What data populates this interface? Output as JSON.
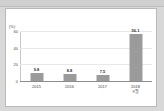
{
  "window": {
    "chrome_strip": "",
    "card_background": "#ffffff",
    "page_background": "#d8d8d8"
  },
  "chart_data": {
    "type": "bar",
    "title": "",
    "xlabel": "",
    "ylabel": "(%)",
    "unit_label": "(%)",
    "categories": [
      "2015",
      "2016",
      "2017",
      "2018"
    ],
    "category_sublabels": [
      "",
      "",
      "",
      "9월"
    ],
    "values": [
      9.8,
      8.8,
      7.5,
      56.1
    ],
    "value_labels": [
      "9.8",
      "8.8",
      "7.5",
      "56.1"
    ],
    "ylim": [
      0,
      60
    ],
    "yticks": [
      0,
      20,
      40,
      60
    ],
    "ytick_labels": [
      "0",
      "20",
      "40",
      "60"
    ],
    "grid": true,
    "legend": false,
    "legend_position": "none",
    "bar_color": "#9b9b9b",
    "gridline_color": "#e8e8e8",
    "axis_color": "#8c8c8c"
  }
}
